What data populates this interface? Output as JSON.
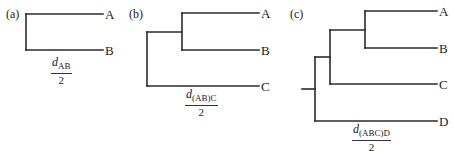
{
  "panels": [
    {
      "id": "a",
      "label": "(a)",
      "taxa": [
        "A",
        "B"
      ],
      "distance_label": {
        "symbol": "d",
        "subscript": "AB",
        "denominator": "2"
      }
    },
    {
      "id": "b",
      "label": "(b)",
      "taxa": [
        "A",
        "B",
        "C"
      ],
      "distance_label": {
        "symbol": "d",
        "subscript": "(AB)C",
        "denominator": "2"
      }
    },
    {
      "id": "c",
      "label": "(c)",
      "taxa": [
        "A",
        "B",
        "C",
        "D"
      ],
      "distance_label": {
        "symbol": "d",
        "subscript": "(ABC)D",
        "denominator": "2"
      }
    }
  ],
  "colors": {
    "line": "#2a2a2a",
    "text": "#222222",
    "background": "#ffffff"
  }
}
